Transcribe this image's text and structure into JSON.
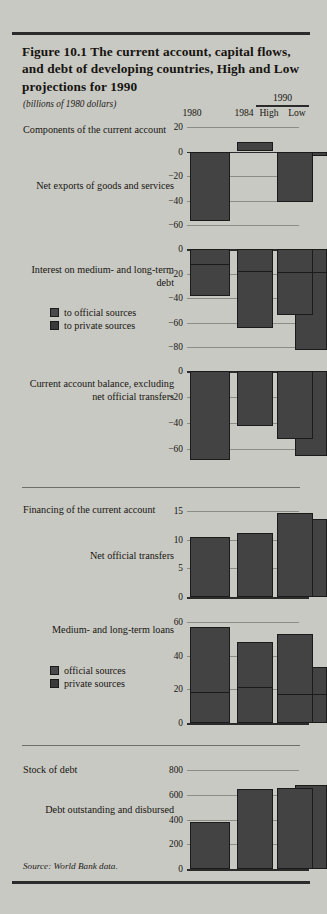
{
  "figure": {
    "title": "Figure 10.1   The current account, capital flows, and debt of developing countries, High and Low projections for 1990",
    "units": "(billions of 1980 dollars)",
    "source": "Source: World Bank data."
  },
  "columns": {
    "group_1990": "1990",
    "c1980": "1980",
    "c1984": "1984",
    "high": "High",
    "low": "Low"
  },
  "sections": {
    "components": "Components of the current account",
    "financing": "Financing of the current account",
    "stock": "Stock of debt"
  },
  "legends": {
    "interest": [
      {
        "label": "to official sources",
        "color": "#4a4a4a"
      },
      {
        "label": "to private sources",
        "color": "#3a3a3a"
      }
    ],
    "loans": [
      {
        "label": "official sources",
        "color": "#4a4a4a"
      },
      {
        "label": "private sources",
        "color": "#3a3a3a"
      }
    ]
  },
  "chart_data": [
    {
      "type": "bar",
      "id": "net-exports",
      "title": "Net exports of goods and services",
      "categories": [
        "1980",
        "1984",
        "High",
        "Low"
      ],
      "values": [
        -57,
        8,
        -41,
        -4
      ],
      "ylabel": "",
      "ylim": [
        -60,
        20
      ],
      "yticks": [
        20,
        0,
        -20,
        -40,
        -60
      ],
      "ytick_labels": [
        "20",
        "0",
        "−20",
        "−40",
        "−60"
      ],
      "grid": true
    },
    {
      "type": "bar",
      "id": "interest-medium-long-term-debt",
      "title": "Interest on medium- and long-term debt",
      "categories": [
        "1980",
        "1984",
        "High",
        "Low"
      ],
      "series": [
        {
          "name": "to official sources",
          "values": [
            -11,
            -17,
            -18,
            -18
          ]
        },
        {
          "name": "to private sources",
          "values": [
            -38,
            -64,
            -54,
            -82
          ]
        }
      ],
      "values": [
        -38,
        -64,
        -54,
        -82
      ],
      "ylim": [
        -88,
        0
      ],
      "yticks": [
        0,
        -20,
        -40,
        -60,
        -80
      ],
      "ytick_labels": [
        "0",
        "−20",
        "−40",
        "−60",
        "−80"
      ],
      "grid": true
    },
    {
      "type": "bar",
      "id": "current-account-balance",
      "title": "Current account balance, excluding net official transfers",
      "categories": [
        "1980",
        "1984",
        "High",
        "Low"
      ],
      "values": [
        -68,
        -42,
        -52,
        -65
      ],
      "ylim": [
        -72,
        0
      ],
      "yticks": [
        0,
        -20,
        -40,
        -60
      ],
      "ytick_labels": [
        "0",
        "−20",
        "−40",
        "−60"
      ],
      "grid": true
    },
    {
      "type": "bar",
      "id": "net-official-transfers",
      "title": "Net official transfers",
      "categories": [
        "1980",
        "1984",
        "High",
        "Low"
      ],
      "values": [
        10.5,
        11.2,
        14.6,
        13.6
      ],
      "ylim": [
        0,
        16
      ],
      "yticks": [
        15,
        10,
        5,
        0
      ],
      "ytick_labels": [
        "15",
        "10",
        "5",
        "0"
      ],
      "grid": true
    },
    {
      "type": "bar",
      "id": "medium-long-term-loans",
      "title": "Medium- and long-term loans",
      "categories": [
        "1980",
        "1984",
        "High",
        "Low"
      ],
      "series": [
        {
          "name": "official sources",
          "values": [
            19,
            22,
            18,
            18
          ]
        },
        {
          "name": "private sources",
          "values": [
            57,
            48,
            53,
            33
          ]
        }
      ],
      "values": [
        57,
        48,
        53,
        33
      ],
      "ylim": [
        0,
        64
      ],
      "yticks": [
        60,
        40,
        20,
        0
      ],
      "ytick_labels": [
        "60",
        "40",
        "20",
        "0"
      ],
      "grid": true
    },
    {
      "type": "bar",
      "id": "debt-outstanding-and-disbursed",
      "title": "Debt outstanding and disbursed",
      "categories": [
        "1980",
        "1984",
        "High",
        "Low"
      ],
      "values": [
        385,
        650,
        655,
        685
      ],
      "ylim": [
        0,
        860
      ],
      "yticks": [
        800,
        600,
        400,
        200,
        0
      ],
      "ytick_labels": [
        "800",
        "600",
        "400",
        "200",
        "0"
      ],
      "grid": true
    }
  ]
}
